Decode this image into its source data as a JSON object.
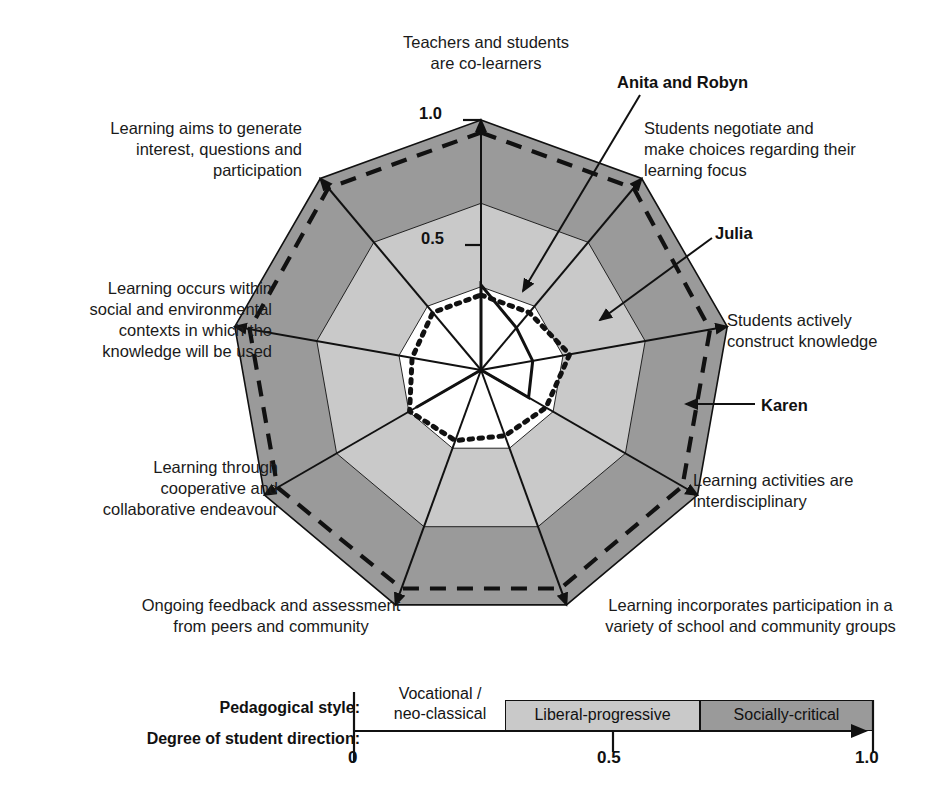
{
  "figure": {
    "background": "#ffffff"
  },
  "radar": {
    "center": {
      "x": 481,
      "y": 370
    },
    "radius": 250,
    "axis_count": 9,
    "start_angle_deg": -90,
    "rings": [
      {
        "value": 1.0,
        "fill": "#9a9a9a",
        "label": "Socially-critical band"
      },
      {
        "value": 0.667,
        "fill": "#c9c9c9",
        "label": "Liberal-progressive band"
      },
      {
        "value": 0.333,
        "fill": "#ffffff",
        "label": "Vocational / neo-classical band"
      }
    ],
    "ticks": [
      {
        "label": "1.0",
        "value": 1.0
      },
      {
        "label": "0.5",
        "value": 0.5
      }
    ],
    "axis_labels": [
      {
        "id": "co-learners",
        "text": "Teachers and students\nare co-learners"
      },
      {
        "id": "negotiate",
        "text": "Students negotiate and\nmake choices regarding their\nlearning focus"
      },
      {
        "id": "construct",
        "text": "Students actively\nconstruct knowledge"
      },
      {
        "id": "interdisciplinary",
        "text": "Learning activities are\ninterdisciplinary"
      },
      {
        "id": "participation",
        "text": "Learning incorporates participation in a\nvariety of school and community groups"
      },
      {
        "id": "feedback",
        "text": "Ongoing feedback and assessment\nfrom peers and community"
      },
      {
        "id": "cooperative",
        "text": "Learning through\ncooperative and\ncollaborative endeavour"
      },
      {
        "id": "contexts",
        "text": "Learning occurs within\nsocial and environmental\ncontexts in which the\nknowledge will be used"
      },
      {
        "id": "interest",
        "text": "Learning aims to generate\ninterest, questions and\nparticipation"
      }
    ],
    "series_callouts": [
      {
        "name": "Anita and Robyn",
        "style": "solid"
      },
      {
        "name": "Julia",
        "style": "dotted"
      },
      {
        "name": "Karen",
        "style": "dashed"
      }
    ]
  },
  "scale": {
    "pedagogical_style_label": "Pedagogical style:",
    "student_direction_label": "Degree of student direction:",
    "bands": [
      {
        "name": "Vocational /\nneo-classical",
        "from": 0.0,
        "to": 0.33,
        "fill": "#ffffff"
      },
      {
        "name": "Liberal-progressive",
        "from": 0.33,
        "to": 0.665,
        "fill": "#c9c9c9"
      },
      {
        "name": "Socially-critical",
        "from": 0.665,
        "to": 1.0,
        "fill": "#9a9a9a"
      }
    ],
    "ticks": [
      {
        "label": "0",
        "value": 0.0
      },
      {
        "label": "0.5",
        "value": 0.5
      },
      {
        "label": "1.0",
        "value": 1.0
      }
    ]
  },
  "chart_data": {
    "type": "radar",
    "categories": [
      "Teachers and students are co-learners",
      "Students negotiate and make choices regarding their learning focus",
      "Students actively construct knowledge",
      "Learning activities are interdisciplinary",
      "Learning incorporates participation in a variety of school and community groups",
      "Ongoing feedback and assessment from peers and community",
      "Learning through cooperative and collaborative endeavour",
      "Learning occurs within social and environmental contexts in which the knowledge will be used",
      "Learning aims to generate interest, questions and participation"
    ],
    "rlim": [
      0,
      1.0
    ],
    "rticks": [
      0.5,
      1.0
    ],
    "grid": true,
    "legend": "callout arrows",
    "series": [
      {
        "name": "Anita and Robyn",
        "style": "solid",
        "values": [
          0.34,
          0.22,
          0.21,
          0.22,
          0.0,
          0.0,
          0.3,
          0.0,
          0.0
        ]
      },
      {
        "name": "Julia",
        "style": "dotted",
        "values": [
          0.3,
          0.3,
          0.36,
          0.3,
          0.28,
          0.3,
          0.33,
          0.28,
          0.3
        ]
      },
      {
        "name": "Karen",
        "style": "dashed",
        "values": [
          0.95,
          0.95,
          0.93,
          0.93,
          0.93,
          0.93,
          0.94,
          0.94,
          0.95
        ]
      }
    ]
  }
}
